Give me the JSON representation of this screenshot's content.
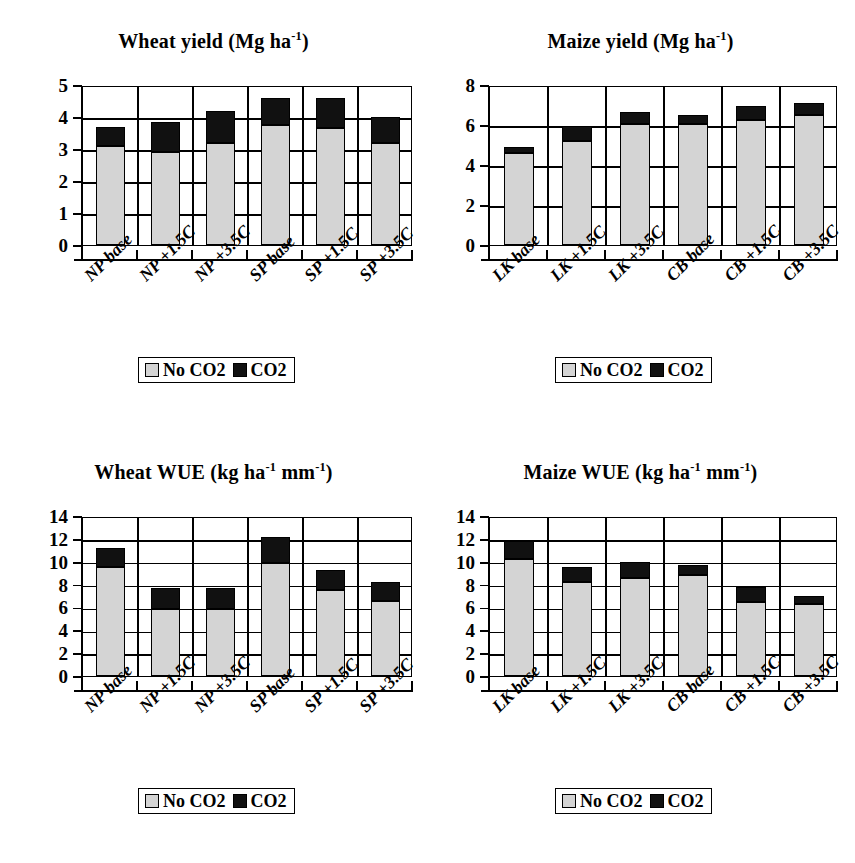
{
  "figure": {
    "background": "#ffffff",
    "colors": {
      "no_co2": "#d4d4d4",
      "co2": "#111111",
      "axis": "#000000"
    }
  },
  "legend": {
    "no_co2_label": "No CO2",
    "co2_label": "CO2"
  },
  "chart_data": [
    {
      "id": "wheat-yield",
      "type": "bar",
      "stacked": true,
      "title": "Wheat yield (Mg ha⁻¹)",
      "title_main": "Wheat yield (Mg ha",
      "title_sup": "-1",
      "title_tail": ")",
      "xlabel": "",
      "ylabel": "",
      "ylim": [
        0,
        5
      ],
      "yticks": [
        0,
        1,
        2,
        3,
        4,
        5
      ],
      "ytick_labels": [
        "0",
        "1",
        "2",
        "3",
        "4",
        "5"
      ],
      "grid": true,
      "legend_position": "bottom-center",
      "categories": [
        "NP base",
        "NP +1.5C",
        "NP +3.5C",
        "SP base",
        "SP +1.5C",
        "SP +3.5C"
      ],
      "series": [
        {
          "name": "No CO2",
          "color": "#d4d4d4",
          "values": [
            3.1,
            2.9,
            3.2,
            3.75,
            3.65,
            3.2
          ]
        },
        {
          "name": "CO2",
          "color": "#111111",
          "values": [
            0.6,
            0.95,
            1.0,
            0.85,
            0.95,
            0.8
          ]
        }
      ],
      "totals": [
        3.7,
        3.85,
        4.2,
        4.6,
        4.6,
        4.0
      ]
    },
    {
      "id": "maize-yield",
      "type": "bar",
      "stacked": true,
      "title": "Maize yield (Mg ha⁻¹)",
      "title_main": "Maize yield (Mg ha",
      "title_sup": "-1",
      "title_tail": ")",
      "xlabel": "",
      "ylabel": "",
      "ylim": [
        0,
        8
      ],
      "yticks": [
        0,
        2,
        4,
        6,
        8
      ],
      "ytick_labels": [
        "0",
        "2",
        "4",
        "6",
        "8"
      ],
      "grid": true,
      "legend_position": "bottom-center",
      "categories": [
        "LK base",
        "LK +1.5C",
        "LK +3.5C",
        "CB base",
        "CB +1.5C",
        "CB +3.5C"
      ],
      "series": [
        {
          "name": "No CO2",
          "color": "#d4d4d4",
          "values": [
            4.6,
            5.2,
            6.05,
            6.05,
            6.25,
            6.5
          ]
        },
        {
          "name": "CO2",
          "color": "#111111",
          "values": [
            0.3,
            0.75,
            0.6,
            0.45,
            0.7,
            0.6
          ]
        }
      ],
      "totals": [
        4.9,
        5.95,
        6.65,
        6.5,
        6.95,
        7.1
      ]
    },
    {
      "id": "wheat-wue",
      "type": "bar",
      "stacked": true,
      "title": "Wheat WUE (kg ha⁻¹ mm⁻¹)",
      "title_main": "Wheat WUE (kg ha",
      "title_sup": "-1",
      "title_mid": " mm",
      "title_sup2": "-1",
      "title_tail": ")",
      "xlabel": "",
      "ylabel": "",
      "ylim": [
        0,
        14
      ],
      "yticks": [
        0,
        2,
        4,
        6,
        8,
        10,
        12,
        14
      ],
      "ytick_labels": [
        "0",
        "2",
        "4",
        "6",
        "8",
        "10",
        "12",
        "14"
      ],
      "grid": true,
      "legend_position": "bottom-center",
      "categories": [
        "NP base",
        "NP +1.5C",
        "NP +3.5C",
        "SP base",
        "SP +1.5C",
        "SP +3.5C"
      ],
      "series": [
        {
          "name": "No CO2",
          "color": "#d4d4d4",
          "values": [
            9.5,
            5.9,
            5.9,
            9.9,
            7.5,
            6.6
          ]
        },
        {
          "name": "CO2",
          "color": "#111111",
          "values": [
            1.7,
            1.8,
            1.8,
            2.3,
            1.8,
            1.6
          ]
        }
      ],
      "totals": [
        11.2,
        7.7,
        7.7,
        12.2,
        9.3,
        8.2
      ]
    },
    {
      "id": "maize-wue",
      "type": "bar",
      "stacked": true,
      "title": "Maize WUE (kg ha⁻¹ mm⁻¹)",
      "title_main": "Maize WUE (kg ha",
      "title_sup": "-1",
      "title_mid": " mm",
      "title_sup2": "-1",
      "title_tail": ")",
      "xlabel": "",
      "ylabel": "",
      "ylim": [
        0,
        14
      ],
      "yticks": [
        0,
        2,
        4,
        6,
        8,
        10,
        12,
        14
      ],
      "ytick_labels": [
        "0",
        "2",
        "4",
        "6",
        "8",
        "10",
        "12",
        "14"
      ],
      "grid": true,
      "legend_position": "bottom-center",
      "categories": [
        "LK base",
        "LK +1.5C",
        "LK +3.5C",
        "CB base",
        "CB +1.5C",
        "CB +3.5C"
      ],
      "series": [
        {
          "name": "No CO2",
          "color": "#d4d4d4",
          "values": [
            10.2,
            8.2,
            8.6,
            8.8,
            6.5,
            6.3
          ]
        },
        {
          "name": "CO2",
          "color": "#111111",
          "values": [
            1.6,
            1.3,
            1.4,
            0.9,
            1.3,
            0.7
          ]
        }
      ],
      "totals": [
        11.8,
        9.5,
        10.0,
        9.7,
        7.8,
        7.0
      ]
    }
  ]
}
